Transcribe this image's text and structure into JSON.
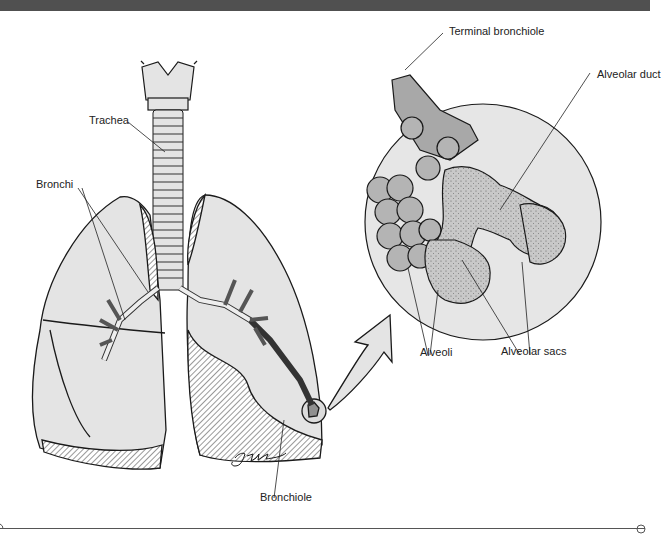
{
  "figure": {
    "labels": {
      "trachea": "Trachea",
      "bronchi": "Bronchi",
      "bronchiole": "Bronchiole",
      "terminal_bronchiole": "Terminal bronchiole",
      "alveolar_duct": "Alveolar duct",
      "alveoli": "Alveoli",
      "alveolar_sacs": "Alveolar sacs"
    },
    "signature": "J Fults"
  },
  "colors": {
    "header_bar": "#505050",
    "lung_fill": "#e4e4e4",
    "alveoli_fill": "#b4b4b4",
    "outline": "#1a1a1a"
  }
}
